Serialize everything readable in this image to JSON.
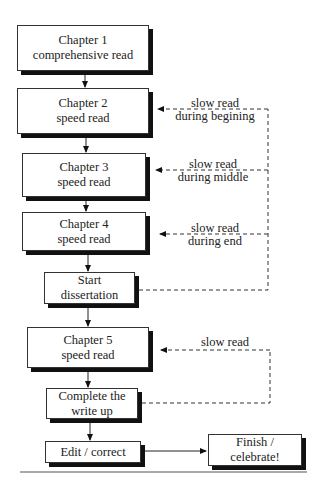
{
  "diagram": {
    "type": "flowchart",
    "nodes": [
      {
        "id": "ch1",
        "line1": "Chapter 1",
        "line2": "comprehensive read"
      },
      {
        "id": "ch2",
        "line1": "Chapter 2",
        "line2": "speed read"
      },
      {
        "id": "ch3",
        "line1": "Chapter 3",
        "line2": "speed read"
      },
      {
        "id": "ch4",
        "line1": "Chapter 4",
        "line2": "speed read"
      },
      {
        "id": "start",
        "line1": "Start",
        "line2": "dissertation"
      },
      {
        "id": "ch5",
        "line1": "Chapter 5",
        "line2": "speed read"
      },
      {
        "id": "complete",
        "line1": "Complete the",
        "line2": "write up"
      },
      {
        "id": "edit",
        "line1": "Edit / correct",
        "line2": ""
      },
      {
        "id": "finish",
        "line1": "Finish /",
        "line2": "celebrate!"
      }
    ],
    "feedback_labels": [
      {
        "line1": "slow read",
        "line2": "during begining"
      },
      {
        "line1": "slow read",
        "line2": "during middle"
      },
      {
        "line1": "slow read",
        "line2": "during end"
      },
      {
        "line1": "slow read",
        "line2": ""
      }
    ],
    "edges": [
      {
        "from": "ch1",
        "to": "ch2",
        "style": "solid"
      },
      {
        "from": "ch2",
        "to": "ch3",
        "style": "solid"
      },
      {
        "from": "ch3",
        "to": "ch4",
        "style": "solid"
      },
      {
        "from": "ch4",
        "to": "start",
        "style": "solid"
      },
      {
        "from": "start",
        "to": "ch5",
        "style": "solid"
      },
      {
        "from": "ch5",
        "to": "complete",
        "style": "solid"
      },
      {
        "from": "complete",
        "to": "edit",
        "style": "solid"
      },
      {
        "from": "edit",
        "to": "finish",
        "style": "solid"
      },
      {
        "from": "start",
        "to": "ch2",
        "style": "dashed",
        "label": "slow read during begining"
      },
      {
        "from": "start",
        "to": "ch3",
        "style": "dashed",
        "label": "slow read during middle"
      },
      {
        "from": "start",
        "to": "ch4",
        "style": "dashed",
        "label": "slow read during end"
      },
      {
        "from": "complete",
        "to": "ch5",
        "style": "dashed",
        "label": "slow read"
      }
    ]
  }
}
